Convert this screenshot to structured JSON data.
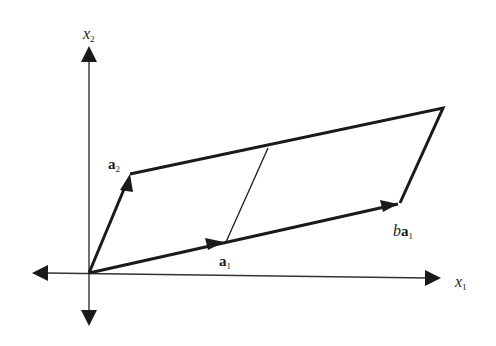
{
  "diagram": {
    "type": "parallelogram-vector-diagram",
    "axes": {
      "horizontal": {
        "label": "x",
        "subscript": "1"
      },
      "vertical": {
        "label": "x",
        "subscript": "2"
      }
    },
    "vectors": {
      "a1": {
        "label": "a",
        "subscript": "1"
      },
      "a2": {
        "label": "a",
        "subscript": "2"
      },
      "ba1": {
        "prefix": "b",
        "label": "a",
        "subscript": "1"
      }
    },
    "colors": {
      "ink": "#1a1a1a",
      "background": "#ffffff"
    }
  }
}
